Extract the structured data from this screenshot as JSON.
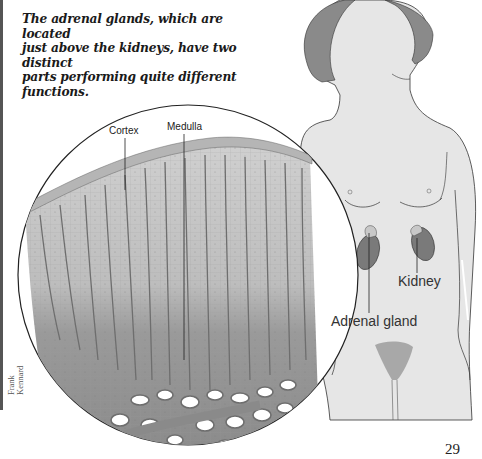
{
  "caption": {
    "line1": "The adrenal glands, which are located",
    "line2": "just above the kidneys, have two distinct",
    "line3": "parts performing quite different",
    "line4": "functions."
  },
  "figure": {
    "labels": {
      "cortex": "Cortex",
      "medulla": "Medulla",
      "kidney": "Kidney",
      "adrenal_gland": "Adrenal gland"
    },
    "colors": {
      "body_fill": "#e6e6e6",
      "hair": "#8a8a8a",
      "kidney": "#7a7a7a",
      "adrenal": "#c8c8c8",
      "tissue_light": "#c9c9c9",
      "tissue_dark": "#8c8c8c",
      "vessels": "#6e6e6e"
    }
  },
  "credit": {
    "line1": "Frank",
    "line2": "Kennard"
  },
  "page_number": "29"
}
